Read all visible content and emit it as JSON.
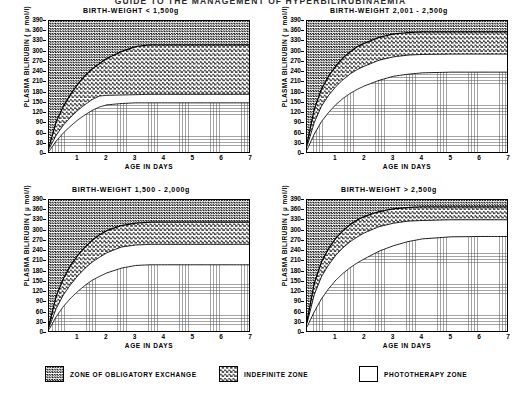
{
  "document": {
    "title": "GUIDE TO THE MANAGEMENT OF HYPERBILIRUBINAEMIA"
  },
  "axes": {
    "y_title": "PLASMA BILIRUBIN  ( µ mol/l)",
    "x_title": "AGE IN DAYS",
    "y_ticks": [
      0,
      30,
      60,
      90,
      120,
      150,
      180,
      210,
      240,
      270,
      300,
      330,
      360,
      390
    ],
    "x_ticks": [
      1,
      2,
      3,
      4,
      5,
      6,
      7
    ],
    "ylim": [
      0,
      390
    ],
    "xlim": [
      0,
      7
    ]
  },
  "legend": {
    "position": "bottom",
    "items": [
      {
        "label": "ZONE OF OBLIGATORY EXCHANGE",
        "pattern": "dense-checkerboard",
        "color": "#1a1a1a"
      },
      {
        "label": "INDEFINITE ZONE",
        "pattern": "medium-checkerboard",
        "color": "#4a4a4a"
      },
      {
        "label": "PHOTOTHERAPY ZONE",
        "pattern": "light-dots",
        "color": "#6e6e6e"
      }
    ]
  },
  "chart_data": [
    {
      "type": "area",
      "title": "BIRTH-WEIGHT < 1,500g",
      "xlabel": "AGE IN DAYS",
      "ylabel": "PLASMA BILIRUBIN  ( µ mol/l)",
      "xlim": [
        0,
        7
      ],
      "ylim": [
        0,
        390
      ],
      "grid": true,
      "x": [
        0,
        0.25,
        0.5,
        0.75,
        1,
        1.25,
        1.5,
        1.75,
        2,
        2.5,
        3,
        3.5,
        4,
        5,
        6,
        7
      ],
      "series": [
        {
          "name": "Exchange transfusion threshold",
          "values": [
            20,
            95,
            140,
            175,
            205,
            230,
            250,
            265,
            280,
            300,
            315,
            320,
            320,
            320,
            320,
            320
          ]
        },
        {
          "name": "Indefinite zone lower boundary",
          "values": [
            15,
            55,
            85,
            108,
            128,
            145,
            160,
            170,
            172,
            173,
            174,
            175,
            175,
            175,
            175,
            175
          ]
        },
        {
          "name": "Phototherapy threshold",
          "values": [
            8,
            38,
            62,
            82,
            100,
            115,
            128,
            138,
            144,
            148,
            150,
            150,
            150,
            150,
            150,
            150
          ]
        }
      ],
      "plateaus": {
        "exchange": 320,
        "indefinite": 175,
        "phototherapy": 150
      }
    },
    {
      "type": "area",
      "title": "BIRTH-WEIGHT  2,001 - 2,500g",
      "xlabel": "AGE IN DAYS",
      "ylabel": "PLASMA BILIRUBIN  ( µ mol/l)",
      "xlim": [
        0,
        7
      ],
      "ylim": [
        0,
        390
      ],
      "grid": true,
      "x": [
        0,
        0.25,
        0.5,
        0.75,
        1,
        1.25,
        1.5,
        1.75,
        2,
        2.5,
        3,
        3.5,
        4,
        5,
        6,
        7
      ],
      "series": [
        {
          "name": "Exchange transfusion threshold",
          "values": [
            30,
            130,
            190,
            228,
            258,
            282,
            300,
            315,
            325,
            342,
            352,
            356,
            358,
            358,
            358,
            358
          ]
        },
        {
          "name": "Indefinite zone lower boundary",
          "values": [
            22,
            92,
            140,
            172,
            198,
            218,
            235,
            248,
            258,
            275,
            285,
            290,
            292,
            293,
            293,
            293
          ]
        },
        {
          "name": "Phototherapy threshold",
          "values": [
            12,
            58,
            95,
            122,
            145,
            163,
            178,
            190,
            200,
            216,
            228,
            234,
            238,
            240,
            240,
            240
          ]
        }
      ],
      "plateaus": {
        "exchange": 358,
        "indefinite": 293,
        "phototherapy": 240
      }
    },
    {
      "type": "area",
      "title": "BIRTH-WEIGHT  1,500 - 2,000g",
      "xlabel": "AGE IN DAYS",
      "ylabel": "PLASMA BILIRUBIN  ( µ mol/l)",
      "xlim": [
        0,
        7
      ],
      "ylim": [
        0,
        390
      ],
      "grid": true,
      "x": [
        0,
        0.25,
        0.5,
        0.75,
        1,
        1.25,
        1.5,
        1.75,
        2,
        2.5,
        3,
        3.5,
        4,
        5,
        6,
        7
      ],
      "series": [
        {
          "name": "Exchange transfusion threshold",
          "values": [
            22,
            108,
            160,
            198,
            228,
            252,
            272,
            288,
            300,
            315,
            322,
            325,
            325,
            325,
            325,
            325
          ]
        },
        {
          "name": "Indefinite zone lower boundary",
          "values": [
            16,
            72,
            112,
            142,
            168,
            190,
            208,
            222,
            235,
            252,
            258,
            260,
            260,
            260,
            260,
            260
          ]
        },
        {
          "name": "Phototherapy threshold",
          "values": [
            10,
            48,
            78,
            102,
            122,
            140,
            155,
            166,
            176,
            190,
            198,
            200,
            200,
            200,
            200,
            200
          ]
        }
      ],
      "plateaus": {
        "exchange": 325,
        "indefinite": 260,
        "phototherapy": 200
      }
    },
    {
      "type": "area",
      "title": "BIRTH-WEIGHT  > 2,500g",
      "xlabel": "AGE IN DAYS",
      "ylabel": "PLASMA BILIRUBIN  ( µ mol/l)",
      "xlim": [
        0,
        7
      ],
      "ylim": [
        0,
        390
      ],
      "grid": true,
      "x": [
        0,
        0.25,
        0.5,
        0.75,
        1,
        1.25,
        1.5,
        1.75,
        2,
        2.5,
        3,
        3.5,
        4,
        5,
        6,
        7
      ],
      "series": [
        {
          "name": "Exchange transfusion threshold",
          "values": [
            35,
            145,
            208,
            248,
            278,
            300,
            318,
            332,
            342,
            356,
            364,
            368,
            370,
            370,
            370,
            370
          ]
        },
        {
          "name": "Indefinite zone lower boundary",
          "values": [
            28,
            112,
            165,
            200,
            228,
            250,
            268,
            282,
            294,
            312,
            322,
            328,
            330,
            332,
            332,
            332
          ]
        },
        {
          "name": "Phototherapy threshold",
          "values": [
            18,
            62,
            100,
            130,
            155,
            175,
            192,
            206,
            218,
            240,
            256,
            268,
            276,
            282,
            283,
            283
          ]
        }
      ],
      "plateaus": {
        "exchange": 370,
        "indefinite": 332,
        "phototherapy": 283
      }
    }
  ]
}
